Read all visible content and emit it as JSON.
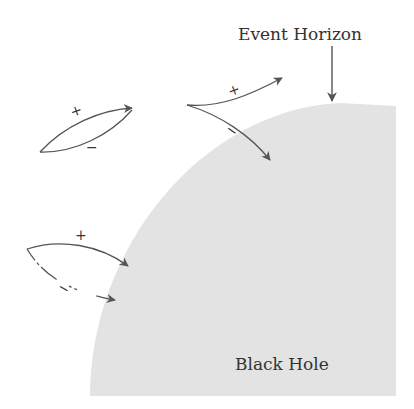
{
  "diagram": {
    "labels": {
      "event_horizon": "Event Horizon",
      "black_hole": "Black Hole"
    },
    "colors": {
      "black_hole_fill": "#e3e3e3",
      "stroke": "#555555",
      "text": "#333333"
    },
    "pairs": [
      {
        "id": "pair-1",
        "plus": "+",
        "minus": "−",
        "description": "Virtual particle pair creation and annihilation far from horizon"
      },
      {
        "id": "pair-2",
        "plus": "+",
        "minus": "−",
        "description": "Pair split at horizon: + escapes, − falls in"
      },
      {
        "id": "pair-3",
        "plus": "+",
        "minus": "−",
        "description": "Pair created near horizon, both fall in"
      }
    ]
  }
}
